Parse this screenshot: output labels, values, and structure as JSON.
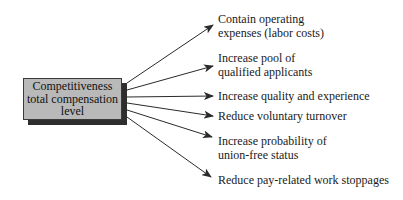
{
  "diagram": {
    "source": {
      "lines": [
        "Competitiveness",
        "total compensation",
        "level"
      ],
      "fill": "#b9b9b9",
      "shadow": "#2e2e2e"
    },
    "outcomes": [
      {
        "lines": [
          "Contain operating",
          "expenses (labor costs)"
        ]
      },
      {
        "lines": [
          "Increase pool of",
          "qualified applicants"
        ]
      },
      {
        "lines": [
          "Increase quality and experience"
        ]
      },
      {
        "lines": [
          "Reduce voluntary turnover"
        ]
      },
      {
        "lines": [
          "Increase probability of",
          "union-free status"
        ]
      },
      {
        "lines": [
          "Reduce pay-related work stoppages"
        ]
      }
    ],
    "arrow_color": "#2a2a2a"
  }
}
